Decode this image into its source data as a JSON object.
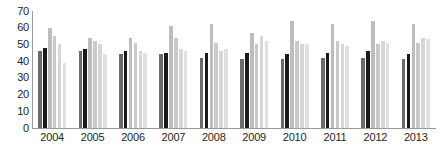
{
  "chart_data": {
    "type": "bar",
    "title": "",
    "subtitle": "",
    "xlabel": "",
    "ylabel": "",
    "ylim": [
      0,
      70
    ],
    "yticks": [
      0,
      10,
      20,
      30,
      40,
      50,
      60,
      70
    ],
    "grid": false,
    "legend": "none",
    "categories": [
      "2004",
      "2005",
      "2006",
      "2007",
      "2008",
      "2009",
      "2010",
      "2011",
      "2012",
      "2013"
    ],
    "series": [
      {
        "name": "Series 1",
        "color": "#6b6b6b",
        "values": [
          46,
          46,
          44,
          44,
          42,
          41,
          41,
          42,
          42,
          41
        ]
      },
      {
        "name": "Series 2",
        "color": "#1a1a1a",
        "values": [
          48,
          47,
          46,
          45,
          45,
          45,
          44,
          45,
          46,
          44
        ]
      },
      {
        "name": "Series 3",
        "color": "#bdbdbd",
        "values": [
          60,
          54,
          54,
          61,
          62,
          57,
          64,
          62,
          64,
          62
        ]
      },
      {
        "name": "Series 4",
        "color": "#c9c9c9",
        "values": [
          55,
          52,
          51,
          54,
          51,
          50,
          52,
          52,
          50,
          51
        ]
      },
      {
        "name": "Series 5",
        "color": "#d6d6d6",
        "values": [
          50,
          50,
          46,
          47,
          46,
          55,
          50,
          50,
          52,
          54
        ]
      },
      {
        "name": "Series 6",
        "color": "#e0e0e0",
        "values": [
          39,
          44,
          45,
          46,
          47,
          52,
          50,
          49,
          51,
          53
        ]
      }
    ]
  },
  "axes": {
    "y_tick_labels": [
      "70",
      "60",
      "50",
      "40",
      "30",
      "20",
      "10",
      "0"
    ],
    "x_tick_labels": [
      "2004",
      "2005",
      "2006",
      "2007",
      "2008",
      "2009",
      "2010",
      "2011",
      "2012",
      "2013"
    ]
  },
  "colors": {
    "axis_line": "#9a9a9a",
    "tick_text": "#262626",
    "background": "#ffffff"
  }
}
